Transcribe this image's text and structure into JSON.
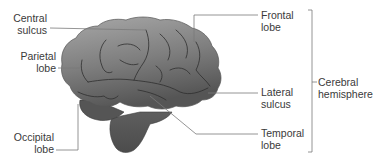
{
  "diagram": {
    "title": "",
    "colors": {
      "brain_fill_light": "#9a9a9a",
      "brain_fill_dark": "#5a5a5a",
      "sulcus_line": "#2e2e2e",
      "leader_line": "#7a7a7a",
      "label_text": "#3a3a3a",
      "background": "#ffffff"
    },
    "labels": {
      "central_sulcus": {
        "line1": "Central",
        "line2": "sulcus"
      },
      "parietal_lobe": {
        "line1": "Parietal",
        "line2": "lobe"
      },
      "occipital_lobe": {
        "line1": "Occipital",
        "line2": "lobe"
      },
      "frontal_lobe": {
        "line1": "Frontal",
        "line2": "lobe"
      },
      "lateral_sulcus": {
        "line1": "Lateral",
        "line2": "sulcus"
      },
      "temporal_lobe": {
        "line1": "Temporal",
        "line2": "lobe"
      },
      "cerebral_hemisphere": {
        "line1": "Cerebral",
        "line2": "hemisphere"
      }
    }
  }
}
